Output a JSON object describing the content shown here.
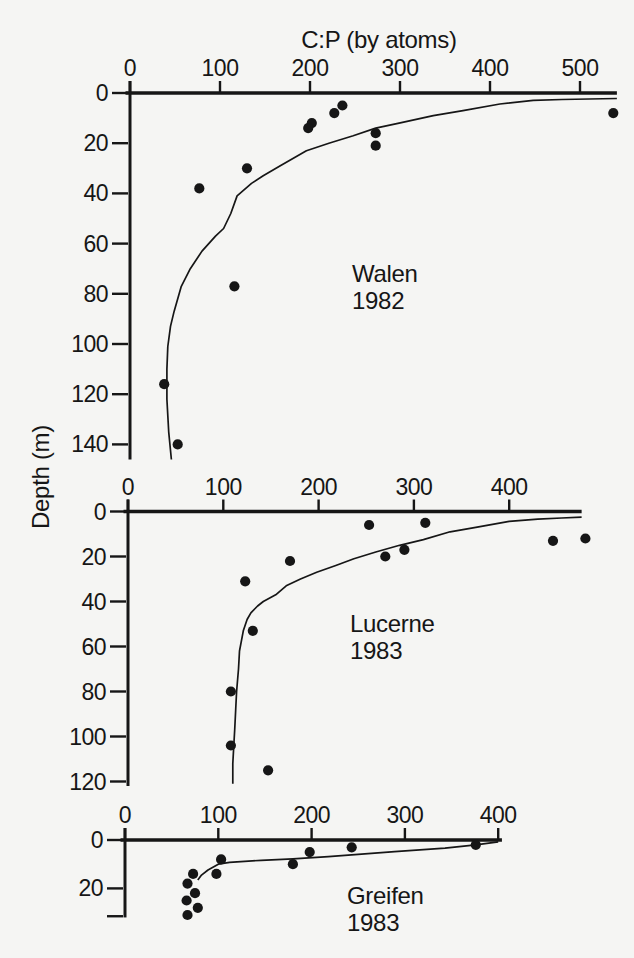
{
  "figure": {
    "title": "C:P (by atoms)",
    "y_axis_label": "Depth (m)",
    "background_color": "#f5f5f3",
    "ink_color": "#161616"
  },
  "chart_data": {
    "type": "scatter",
    "title": "C:P (by atoms)",
    "xlabel": "C:P (by atoms)",
    "ylabel": "Depth (m)",
    "legend": "none",
    "grid": false,
    "panels": [
      {
        "name": "Walen",
        "year": "1982",
        "x_ticks": [
          0,
          100,
          200,
          300,
          400,
          500
        ],
        "y_ticks": [
          0,
          20,
          40,
          60,
          80,
          100,
          120,
          140
        ],
        "extra_y_ticks": [],
        "x_range": [
          0,
          541
        ],
        "y_range": [
          0,
          146
        ],
        "points_cp_depth": [
          [
            236,
            5
          ],
          [
            227,
            8
          ],
          [
            202,
            12
          ],
          [
            198,
            14
          ],
          [
            273,
            16
          ],
          [
            273,
            21
          ],
          [
            130,
            30
          ],
          [
            77,
            38
          ],
          [
            537,
            8
          ],
          [
            116,
            77
          ],
          [
            38,
            116
          ],
          [
            53,
            140
          ]
        ],
        "fit_curve_cp_depth": [
          [
            46,
            146
          ],
          [
            43,
            135
          ],
          [
            41,
            122
          ],
          [
            41,
            110
          ],
          [
            42,
            101
          ],
          [
            45,
            93
          ],
          [
            49,
            87
          ],
          [
            57,
            77
          ],
          [
            67,
            70
          ],
          [
            80,
            63
          ],
          [
            95,
            57
          ],
          [
            104,
            54
          ],
          [
            112,
            48
          ],
          [
            119,
            41
          ],
          [
            135,
            36
          ],
          [
            148,
            33
          ],
          [
            167,
            29
          ],
          [
            196,
            23
          ],
          [
            221,
            20
          ],
          [
            248,
            17
          ],
          [
            273,
            14
          ],
          [
            299,
            12
          ],
          [
            337,
            9
          ],
          [
            370,
            7
          ],
          [
            411,
            4.4
          ],
          [
            448,
            2.9
          ],
          [
            480,
            2.6
          ],
          [
            510,
            2.4
          ],
          [
            541,
            2.2
          ]
        ],
        "layout": {
          "x0": 130,
          "xs": 0.9,
          "y0": 93,
          "ys": 2.51,
          "label_x": 352,
          "label_y": 260
        }
      },
      {
        "name": "Lucerne",
        "year": "1983",
        "x_ticks": [
          0,
          100,
          200,
          300,
          400
        ],
        "y_ticks": [
          0,
          20,
          40,
          60,
          80,
          100,
          120
        ],
        "extra_y_ticks": [],
        "x_range": [
          0,
          476
        ],
        "y_range": [
          0,
          122
        ],
        "points_cp_depth": [
          [
            253,
            6
          ],
          [
            312,
            5
          ],
          [
            446,
            13
          ],
          [
            480,
            12
          ],
          [
            290,
            17
          ],
          [
            270,
            20
          ],
          [
            170,
            22
          ],
          [
            123,
            31
          ],
          [
            131,
            53
          ],
          [
            108,
            80
          ],
          [
            108,
            104
          ],
          [
            147,
            115
          ]
        ],
        "fit_curve_cp_depth": [
          [
            110,
            121
          ],
          [
            110,
            112
          ],
          [
            111,
            104
          ],
          [
            112,
            97
          ],
          [
            113,
            88
          ],
          [
            114,
            80
          ],
          [
            116,
            70
          ],
          [
            117,
            62
          ],
          [
            121,
            53
          ],
          [
            125,
            48
          ],
          [
            129,
            45
          ],
          [
            136,
            42
          ],
          [
            142,
            40
          ],
          [
            155,
            37
          ],
          [
            166,
            33
          ],
          [
            181,
            30
          ],
          [
            198,
            27
          ],
          [
            218,
            24
          ],
          [
            237,
            21
          ],
          [
            260,
            18
          ],
          [
            285,
            15
          ],
          [
            310,
            12.5
          ],
          [
            338,
            9
          ],
          [
            365,
            7
          ],
          [
            400,
            4.4
          ],
          [
            430,
            3.4
          ],
          [
            455,
            2.9
          ],
          [
            476,
            2.5
          ]
        ],
        "layout": {
          "x0": 128,
          "xs": 0.953,
          "y0": 511.5,
          "ys": 2.25,
          "label_x": 350,
          "label_y": 610
        }
      },
      {
        "name": "Greifen",
        "year": "1983",
        "x_ticks": [
          0,
          100,
          200,
          300,
          400
        ],
        "y_ticks": [
          0,
          20
        ],
        "extra_y_ticks": [
          31.5
        ],
        "x_range": [
          0,
          404
        ],
        "y_range": [
          0,
          32
        ],
        "points_cp_depth": [
          [
            376,
            2
          ],
          [
            243,
            3
          ],
          [
            198,
            5
          ],
          [
            180,
            10
          ],
          [
            103,
            8
          ],
          [
            98,
            14
          ],
          [
            73,
            14
          ],
          [
            67,
            18
          ],
          [
            75,
            22
          ],
          [
            66,
            25
          ],
          [
            78,
            28
          ],
          [
            67,
            31
          ]
        ],
        "fit_curve_cp_depth": [
          [
            400,
            0.8
          ],
          [
            376,
            2
          ],
          [
            343,
            3.4
          ],
          [
            289,
            4.8
          ],
          [
            218,
            6.9
          ],
          [
            180,
            7.8
          ],
          [
            146,
            8.4
          ],
          [
            112,
            9.2
          ],
          [
            100,
            10
          ],
          [
            89,
            12.4
          ],
          [
            82,
            14.5
          ],
          [
            78,
            16.5
          ]
        ],
        "layout": {
          "x0": 125,
          "xs": 0.933,
          "y0": 840,
          "ys": 2.42,
          "label_x": 347,
          "label_y": 882
        }
      }
    ],
    "title_pos": {
      "x": 379,
      "y": 26
    },
    "ylabel_pos": {
      "x": 41,
      "y": 477
    }
  }
}
